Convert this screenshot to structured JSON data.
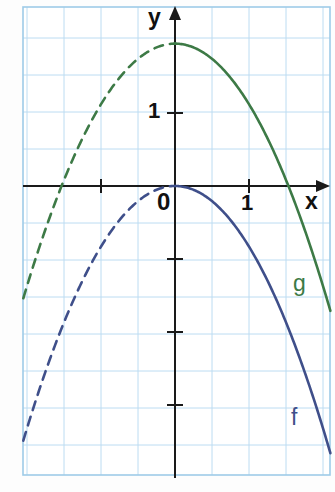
{
  "figure": {
    "title": "",
    "background_color": "#fdfdfd",
    "grid_color": "#bcdcf2",
    "grid_border_color": "#9ecbe8",
    "axis_color": "#1a1a1a"
  },
  "axes": {
    "x_axis_label": "x",
    "y_axis_label": "y",
    "origin_label": "0",
    "x_tick_label": "1",
    "y_tick_label": "1",
    "x_tick_values": [
      -1,
      1
    ],
    "y_tick_values": [
      1,
      -1,
      -2,
      -3
    ],
    "x_range": [
      -2.05,
      2.1
    ],
    "y_range": [
      -3.9,
      2.5
    ],
    "grid": true,
    "grid_step": 0.5
  },
  "curves": {
    "f": {
      "label": "f",
      "color": "#3f4f8a",
      "vertex": [
        0,
        0
      ],
      "leading_coefficient": -0.83,
      "solid_domain": [
        0,
        2.1
      ],
      "dashed_domain": [
        -2.05,
        0
      ]
    },
    "g": {
      "label": "g",
      "color": "#3d7a46",
      "vertex": [
        0,
        1.95
      ],
      "leading_coefficient": -0.83,
      "roots": [
        -1.53,
        1.53
      ],
      "solid_domain": [
        0,
        2.1
      ],
      "dashed_domain": [
        -2.05,
        0
      ]
    }
  },
  "chart_data": {
    "type": "line",
    "title": "",
    "xlabel": "x",
    "ylabel": "y",
    "xlim": [
      -2.05,
      2.1
    ],
    "ylim": [
      -3.9,
      2.5
    ],
    "grid": true,
    "legend": "inline-curve-labels",
    "series": [
      {
        "name": "f",
        "color": "#3f4f8a",
        "equation": "f(x) = -0.83 x^2",
        "x": [
          -2.0,
          -1.75,
          -1.5,
          -1.25,
          -1.0,
          -0.75,
          -0.5,
          -0.25,
          0,
          0.25,
          0.5,
          0.75,
          1.0,
          1.25,
          1.5,
          1.75,
          2.0
        ],
        "values": [
          -3.32,
          -2.54,
          -1.87,
          -1.3,
          -0.83,
          -0.47,
          -0.21,
          -0.05,
          0,
          -0.05,
          -0.21,
          -0.47,
          -0.83,
          -1.3,
          -1.87,
          -2.54,
          -3.32
        ],
        "linestyle_negative_x": "dashed",
        "linestyle_positive_x": "solid"
      },
      {
        "name": "g",
        "color": "#3d7a46",
        "equation": "g(x) = -0.83 x^2 + 1.95",
        "x": [
          -2.0,
          -1.75,
          -1.5,
          -1.25,
          -1.0,
          -0.75,
          -0.5,
          -0.25,
          0,
          0.25,
          0.5,
          0.75,
          1.0,
          1.25,
          1.5,
          1.75,
          2.0
        ],
        "values": [
          -1.37,
          -0.59,
          0.08,
          0.65,
          1.12,
          1.48,
          1.74,
          1.9,
          1.95,
          1.9,
          1.74,
          1.48,
          1.12,
          0.65,
          0.08,
          -0.59,
          -1.37
        ],
        "linestyle_negative_x": "dashed",
        "linestyle_positive_x": "solid"
      }
    ]
  }
}
